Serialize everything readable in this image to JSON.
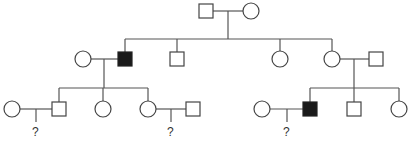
{
  "diagram": {
    "type": "pedigree",
    "colors": {
      "line": "#555555",
      "unaffected_fill": "#ffffff",
      "affected_fill": "#1a1a1a"
    },
    "unknown_label": "?",
    "individuals": [
      {
        "id": "I-1",
        "sex": "male",
        "affected": false,
        "generation": 1
      },
      {
        "id": "I-2",
        "sex": "female",
        "affected": false,
        "generation": 1
      },
      {
        "id": "II-1",
        "sex": "female",
        "affected": false,
        "generation": 2,
        "note": "spouse of II-2"
      },
      {
        "id": "II-2",
        "sex": "male",
        "affected": true,
        "generation": 2
      },
      {
        "id": "II-3",
        "sex": "male",
        "affected": false,
        "generation": 2
      },
      {
        "id": "II-4",
        "sex": "female",
        "affected": false,
        "generation": 2
      },
      {
        "id": "II-5",
        "sex": "female",
        "affected": false,
        "generation": 2
      },
      {
        "id": "II-6",
        "sex": "male",
        "affected": false,
        "generation": 2,
        "note": "spouse of II-5"
      },
      {
        "id": "III-1",
        "sex": "female",
        "affected": false,
        "generation": 3,
        "note": "spouse of III-2"
      },
      {
        "id": "III-2",
        "sex": "male",
        "affected": false,
        "generation": 3
      },
      {
        "id": "III-3",
        "sex": "female",
        "affected": false,
        "generation": 3
      },
      {
        "id": "III-4",
        "sex": "female",
        "affected": false,
        "generation": 3
      },
      {
        "id": "III-5",
        "sex": "male",
        "affected": false,
        "generation": 3,
        "note": "spouse of III-4"
      },
      {
        "id": "III-6",
        "sex": "female",
        "affected": false,
        "generation": 3,
        "note": "spouse of III-7"
      },
      {
        "id": "III-7",
        "sex": "male",
        "affected": true,
        "generation": 3
      },
      {
        "id": "III-8",
        "sex": "male",
        "affected": false,
        "generation": 3
      },
      {
        "id": "III-9",
        "sex": "female",
        "affected": false,
        "generation": 3
      }
    ],
    "unknown_offspring": [
      {
        "parents": [
          "III-1",
          "III-2"
        ],
        "label": "?"
      },
      {
        "parents": [
          "III-4",
          "III-5"
        ],
        "label": "?"
      },
      {
        "parents": [
          "III-6",
          "III-7"
        ],
        "label": "?"
      }
    ]
  }
}
